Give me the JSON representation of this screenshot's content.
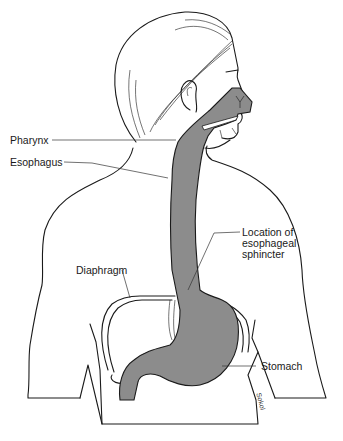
{
  "diagram": {
    "organ_fill_color": "#8c8c8c",
    "line_color": "#1a1a1a",
    "background_color": "#ffffff",
    "labels": {
      "pharynx": "Pharynx",
      "esophagus": "Esophagus",
      "sphincter_line1": "Location of",
      "sphincter_line2": "esophageal",
      "sphincter_line3": "sphincter",
      "diaphragm": "Diaphragm",
      "stomach": "Stomach"
    },
    "artist_signature": "Sokol"
  }
}
